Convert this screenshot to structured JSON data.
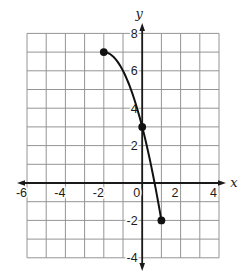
{
  "figure": {
    "background": "#ffffff",
    "grid_color": "#949494",
    "axis_color": "#1a1a1a",
    "curve_color": "#111111",
    "point_color": "#111111"
  },
  "chart_data": {
    "type": "line",
    "title": "",
    "xlabel": "x",
    "ylabel": "y",
    "xlim": [
      -6,
      4
    ],
    "ylim": [
      -4,
      8
    ],
    "grid": true,
    "grid_step": 1,
    "x_ticks": [
      {
        "value": -6,
        "label": "-6"
      },
      {
        "value": -4,
        "label": "-4"
      },
      {
        "value": -2,
        "label": "-2"
      },
      {
        "value": 0,
        "label": "0"
      },
      {
        "value": 2,
        "label": "2"
      },
      {
        "value": 4,
        "label": "4"
      }
    ],
    "y_ticks": [
      {
        "value": 8,
        "label": "8"
      },
      {
        "value": 6,
        "label": "6"
      },
      {
        "value": 4,
        "label": "4"
      },
      {
        "value": 2,
        "label": "2"
      },
      {
        "value": -2,
        "label": "-2"
      },
      {
        "value": -4,
        "label": "-4"
      }
    ],
    "series": [
      {
        "name": "curve",
        "style": "smooth",
        "marker": "filled-dot",
        "points": [
          [
            -2,
            7
          ],
          [
            0,
            3
          ],
          [
            1,
            -2
          ]
        ]
      }
    ]
  }
}
